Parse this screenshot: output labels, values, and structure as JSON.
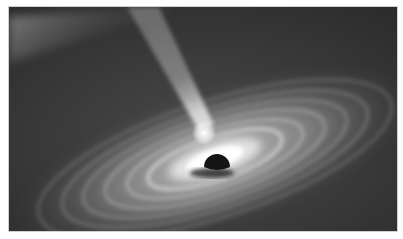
{
  "image": {
    "subject": "black hole with accretion disk and relativistic jet",
    "palette": {
      "background": "#3a3a3a",
      "space_dark": "#2e2e2e",
      "disk_bright": "#ffffff",
      "disk_mid": "#a8a8a8",
      "event_horizon": "#141414",
      "jet": "#d8d8d8"
    }
  }
}
